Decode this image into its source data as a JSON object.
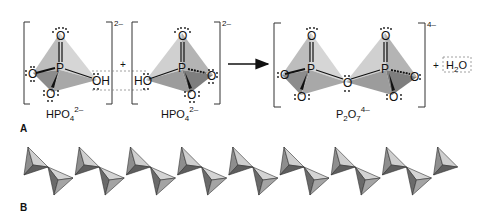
{
  "panel_a": {
    "label": "A",
    "reaction": {
      "reactant_1": {
        "name": "HPO",
        "sub": "4",
        "charge": "2–",
        "atoms": {
          "top_o": "O",
          "left_o": "O",
          "bottom_o": "O",
          "center_p": "P",
          "right_oh": "OH"
        }
      },
      "plus_1": "+",
      "reactant_2": {
        "name": "HPO",
        "sub": "4",
        "charge": "2–",
        "atoms": {
          "top_o": "O",
          "right_o": "O",
          "bottom_o": "O",
          "center_p": "P",
          "left_ho": "HO"
        }
      },
      "arrow": "reaction-arrow",
      "product": {
        "name": "P",
        "sub1": "2",
        "name2": "O",
        "sub2": "7",
        "charge": "4–",
        "atoms": {
          "p1": "P",
          "p2": "P",
          "bridge_o": "O",
          "o1_top": "O",
          "o1_left": "O",
          "o1_bottom": "O",
          "o2_top": "O",
          "o2_right": "O",
          "o2_bottom": "O"
        }
      },
      "plus_2": "+",
      "byproduct": {
        "h": "H",
        "sub": "2",
        "o": "O"
      }
    }
  },
  "panel_b": {
    "label": "B",
    "description": "Chain of corner-sharing phosphate tetrahedra",
    "up_tetrahedra_count": 9,
    "down_tetrahedra_count": 8
  },
  "colors": {
    "tetra_light": "#c8c8c8",
    "tetra_mid": "#a6a6a6",
    "tetra_dark": "#6e6e6e",
    "ink": "#111111",
    "dashed": "#888888"
  }
}
